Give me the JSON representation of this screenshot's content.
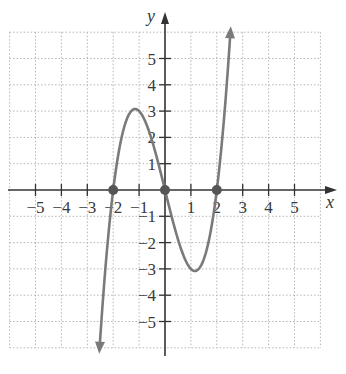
{
  "chart_data": {
    "type": "line",
    "title": "",
    "xlabel": "x",
    "ylabel": "y",
    "xlim": [
      -6,
      6
    ],
    "ylim": [
      -6,
      6
    ],
    "grid": true,
    "x_ticks": [
      -5,
      -4,
      -3,
      -2,
      -1,
      1,
      2,
      3,
      4,
      5
    ],
    "y_ticks": [
      5,
      4,
      3,
      2,
      1,
      -1,
      -2,
      -3,
      -4,
      -5
    ],
    "x_tick_labels": [
      "−5",
      "−4",
      "−3",
      "−2",
      "−1",
      "1",
      "2",
      "3",
      "4",
      "5"
    ],
    "y_tick_labels": [
      "5",
      "4",
      "3",
      "2",
      "1",
      "−1",
      "−2",
      "−3",
      "−4",
      "−5"
    ],
    "series": [
      {
        "name": "f(x)",
        "description": "cubic curve with arrows at both ends, zeros at x = -2, 0, 2; local max near (-1.15, 3.08), local min near (1.15, -3.08)",
        "x_range": [
          -2.52,
          2.52
        ],
        "points": [
          [
            -2.5,
            -5.6
          ],
          [
            -2,
            0
          ],
          [
            -1.15,
            3.08
          ],
          [
            0,
            0
          ],
          [
            1.15,
            -3.08
          ],
          [
            2,
            0
          ],
          [
            2.5,
            5.6
          ]
        ]
      }
    ],
    "highlighted_points": [
      [
        -2,
        0
      ],
      [
        0,
        0
      ],
      [
        2,
        0
      ]
    ],
    "colors": {
      "curve": "#7a7a7a",
      "axis": "#333333",
      "grid": "#b5b5b5",
      "point": "#555555"
    }
  }
}
